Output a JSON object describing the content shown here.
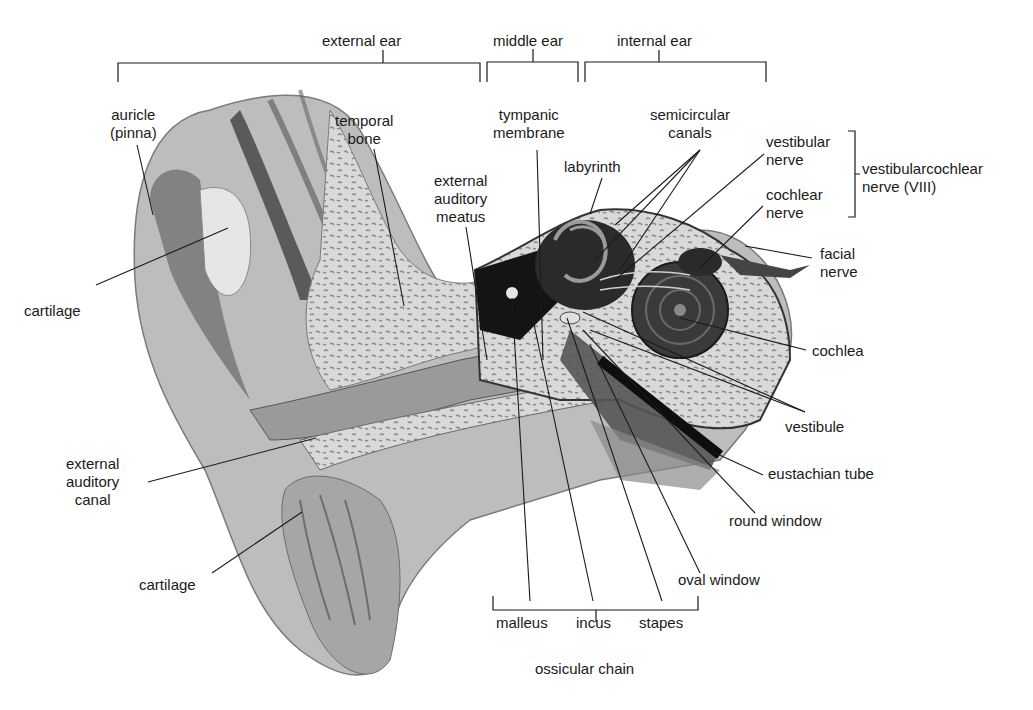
{
  "colors": {
    "background": "#ffffff",
    "text": "#1a1a1a",
    "leader_line": "#1a1a1a",
    "skin_light": "#c9c9c9",
    "skin_mid": "#a8a8a8",
    "skin_dark": "#6f6f6f",
    "bone": "#d6d6d6",
    "cavity": "#141414"
  },
  "regions": {
    "external_ear": "external ear",
    "middle_ear": "middle ear",
    "internal_ear": "internal ear"
  },
  "labels": {
    "auricle": [
      "auricle",
      "(pinna)"
    ],
    "temporal_bone": [
      "temporal",
      "bone"
    ],
    "external_auditory_meatus": [
      "external",
      "auditory",
      "meatus"
    ],
    "tympanic_membrane": [
      "tympanic",
      "membrane"
    ],
    "labyrinth": [
      "labyrinth"
    ],
    "semicircular_canals": [
      "semicircular",
      "canals"
    ],
    "vestibular_nerve": [
      "vestibular",
      "nerve"
    ],
    "cochlear_nerve": [
      "cochlear",
      "nerve"
    ],
    "vestibulocochlear_nerve": [
      "vestibularcochlear",
      "nerve (VIII)"
    ],
    "facial_nerve": [
      "facial",
      "nerve"
    ],
    "cartilage_upper": [
      "cartilage"
    ],
    "cochlea": [
      "cochlea"
    ],
    "vestibule": [
      "vestibule"
    ],
    "external_auditory_canal": [
      "external",
      "auditory",
      "canal"
    ],
    "eustachian_tube": [
      "eustachian tube"
    ],
    "round_window": [
      "round window"
    ],
    "cartilage_lower": [
      "cartilage"
    ],
    "oval_window": [
      "oval window"
    ],
    "malleus": [
      "malleus"
    ],
    "incus": [
      "incus"
    ],
    "stapes": [
      "stapes"
    ],
    "ossicular_chain": [
      "ossicular chain"
    ]
  }
}
